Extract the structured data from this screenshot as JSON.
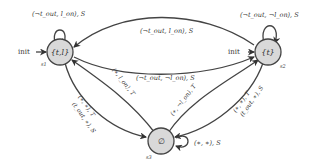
{
  "diagram": {
    "type": "state-machine",
    "nodes": [
      {
        "id": "s1",
        "label": "{t,l}",
        "name": "s1",
        "initial": true
      },
      {
        "id": "s2",
        "label": "{t}",
        "name": "s2",
        "initial": true
      },
      {
        "id": "s3",
        "label": "∅",
        "name": "s3",
        "initial": false
      }
    ],
    "init_label": "init",
    "edges": [
      {
        "from": "s1",
        "to": "s1",
        "label": "(¬t_out, l_on), S"
      },
      {
        "from": "s2",
        "to": "s1",
        "label": "(¬t_out, l_on), S"
      },
      {
        "from": "s1",
        "to": "s2",
        "label": "(¬t_out, ¬l_on), S"
      },
      {
        "from": "s2",
        "to": "s2",
        "label": "(¬t_out, ¬l_on), S"
      },
      {
        "from": "s3",
        "to": "s1",
        "label": "(∗, l_on), T"
      },
      {
        "from": "s1",
        "to": "s3",
        "label": "(∗, ∗), T / (t_out, ∗), S"
      },
      {
        "from": "s3",
        "to": "s2",
        "label": "(∗, ¬l_on), T"
      },
      {
        "from": "s2",
        "to": "s3",
        "label": "(∗, ∗), T / (t_out, ∗), S"
      },
      {
        "from": "s3",
        "to": "s3",
        "label": "(∗, ∗), S"
      }
    ],
    "labels": {
      "loop_s1": "(¬t",
      "loop_s1_sub": "out",
      "loop_s1_mid": ", l",
      "loop_s1_sub2": "on",
      "loop_s1_end": "), S",
      "s2_to_s1_a": "(¬t",
      "s2_to_s1_b": "out",
      "s2_to_s1_c": ", l",
      "s2_to_s1_d": "on",
      "s2_to_s1_e": "), S",
      "s1_to_s2_a": "(¬t",
      "s1_to_s2_b": "out",
      "s1_to_s2_c": ", ¬l",
      "s1_to_s2_d": "on",
      "s1_to_s2_e": "), S",
      "loop_s2_a": "(¬t",
      "loop_s2_b": "out",
      "loop_s2_c": ", ¬l",
      "loop_s2_d": "on",
      "loop_s2_e": "), S",
      "s3_to_s1": "(∗, l_on), T",
      "s1_to_s3_1": "(∗, ∗), T",
      "s1_to_s3_2": "(t_out, ∗), S",
      "s3_to_s2": "(∗, ¬l_on), T",
      "s2_to_s3_1": "(∗, ∗), T",
      "s2_to_s3_2": "(t_out, ∗), S",
      "loop_s3": "(∗, ∗), S"
    },
    "colors": {
      "node_fill": "#d9d9d9",
      "stroke": "#444444",
      "text": "#333333"
    }
  }
}
